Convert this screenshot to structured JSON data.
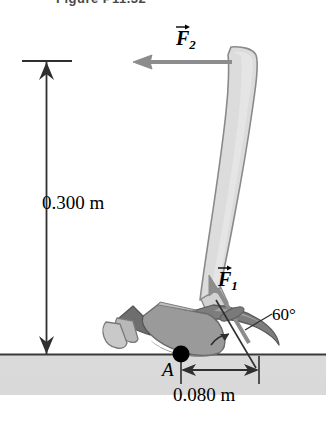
{
  "figure": {
    "caption": "Figure P11.32",
    "ground_label": "ground-surface"
  },
  "labels": {
    "height_dimension": "0.300 m",
    "width_dimension": "0.080 m",
    "pivot_point": "A",
    "angle": "60°"
  },
  "vectors": [
    {
      "id": "F1",
      "symbol": "F",
      "subscript": "1",
      "name": "force-f1",
      "direction": "up-left-diagonal"
    },
    {
      "id": "F2",
      "symbol": "F",
      "subscript": "2",
      "name": "force-f2",
      "direction": "left-horizontal"
    }
  ],
  "colors": {
    "handle_fill": "#dcdcdc",
    "handle_stroke": "#8a8a8a",
    "head_mid": "#9a9a9a",
    "head_dark": "#6e6e6e",
    "head_light": "#c4c4c4",
    "ground_band": "#d8d8d8",
    "ground_line": "#3a3a3a",
    "arrow_gray": "#8c8c8c",
    "dim_line": "#3a3a3a",
    "pivot_dot": "#000000",
    "caption_text": "#4a4a4a"
  }
}
